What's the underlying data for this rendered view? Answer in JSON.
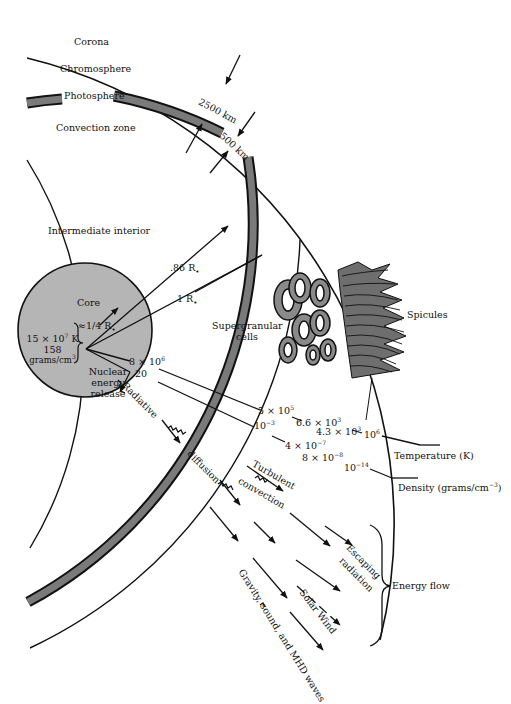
{
  "layers": {
    "corona": "Corona",
    "chromosphere": "Chromosphere",
    "photosphere": "Photosphere",
    "convection_zone": "Convection zone",
    "intermediate_interior": "Intermediate interior",
    "core": "Core"
  },
  "thickness": {
    "chromosphere": "2500 km",
    "photosphere": "500 km"
  },
  "radii": {
    "convection_base": ".86 R",
    "surface": "1 R",
    "core": "≈1/4 R",
    "sun_symbol": "•"
  },
  "core_conditions": {
    "temperature": "15 × 10",
    "temperature_exp": "7",
    "temperature_unit": " K",
    "density": "158",
    "density_unit": "grams/cm",
    "density_unit_exp": "3",
    "process_line1": "Nuclear",
    "process_line2": "energy",
    "process_line3": "release"
  },
  "features": {
    "supergranular_line1": "Supergranular",
    "supergranular_line2": "cells",
    "spicules": "Spicules"
  },
  "temperature_profile": {
    "label": "Temperature (K)",
    "values": [
      {
        "base": "8 × 10",
        "exp": "6",
        "where": "core edge"
      },
      {
        "base": "5 × 10",
        "exp": "5",
        "where": "base of convection zone"
      },
      {
        "base": "6.6 × 10",
        "exp": "3",
        "where": "photosphere"
      },
      {
        "base": "4.3 × 10",
        "exp": "3",
        "where": "chromosphere"
      },
      {
        "base": "10",
        "exp": "6",
        "where": "corona"
      }
    ]
  },
  "density_profile": {
    "label": "Density (grams/cm",
    "label_exp": "−3",
    "label_close": ")",
    "values": [
      {
        "base": "20",
        "exp": "",
        "where": "core edge"
      },
      {
        "base": "10",
        "exp": "−3",
        "where": "base of convection zone"
      },
      {
        "base": "4 × 10",
        "exp": "−7",
        "where": "photosphere"
      },
      {
        "base": "8 × 10",
        "exp": "−8",
        "where": "chromosphere"
      },
      {
        "base": "10",
        "exp": "−14",
        "where": "corona"
      }
    ]
  },
  "energy_transport": {
    "radiative": "Radiative",
    "diffusion": "diffusion",
    "turbulent": "Turbulent",
    "convection": "convection",
    "escaping": "Escaping",
    "radiation": "radiation",
    "solar_wind": "Solar Wind",
    "waves": "Gravity, sound, and MHD waves",
    "energy_flow": "Energy flow"
  },
  "colors": {
    "ink": "#111111",
    "photosphere_fill": "#7a7a7a",
    "core_fill": "#b5b5b5",
    "spicule_fill": "#6e6e6e",
    "background": "#ffffff"
  }
}
